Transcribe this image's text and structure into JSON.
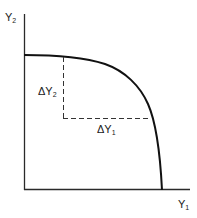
{
  "diagram": {
    "type": "production-possibilities-frontier",
    "axes": {
      "y_label": {
        "main": "Y",
        "sub": "2"
      },
      "x_label": {
        "main": "Y",
        "sub": "1"
      }
    },
    "annotations": {
      "delta_y2": {
        "main": "ΔY",
        "sub": "2"
      },
      "delta_y1": {
        "main": "ΔY",
        "sub": "1"
      }
    },
    "colors": {
      "line": "#1a1a1a",
      "background": "#ffffff"
    }
  }
}
